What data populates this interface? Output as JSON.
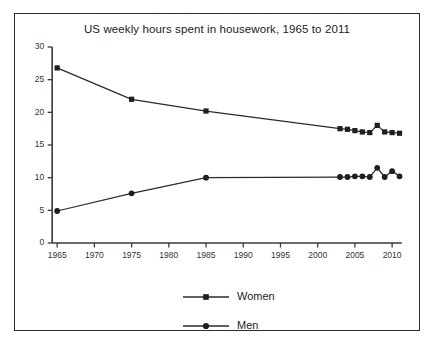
{
  "chart_data": {
    "type": "line",
    "title": "US weekly hours spent in housework, 1965 to 2011",
    "xlabel": "",
    "ylabel": "",
    "xlim": [
      1963.5,
      2012
    ],
    "ylim": [
      0,
      30
    ],
    "xticks": [
      1965,
      1970,
      1975,
      1980,
      1985,
      1990,
      1995,
      2000,
      2005,
      2010
    ],
    "yticks": [
      0,
      5,
      10,
      15,
      20,
      25,
      30
    ],
    "grid": false,
    "legend_position": "bottom",
    "series": [
      {
        "name": "Women",
        "marker": "square",
        "color": "#1f1f1f",
        "x": [
          1965,
          1975,
          1985,
          2003,
          2004,
          2005,
          2006,
          2007,
          2008,
          2009,
          2010,
          2011
        ],
        "values": [
          26.8,
          22.0,
          20.2,
          17.5,
          17.4,
          17.2,
          17.0,
          16.9,
          18.0,
          17.0,
          16.9,
          16.8
        ]
      },
      {
        "name": "Men",
        "marker": "circle",
        "color": "#1f1f1f",
        "x": [
          1965,
          1975,
          1985,
          2003,
          2004,
          2005,
          2006,
          2007,
          2008,
          2009,
          2010,
          2011
        ],
        "values": [
          4.9,
          7.6,
          10.0,
          10.1,
          10.1,
          10.2,
          10.2,
          10.1,
          11.5,
          10.1,
          11.0,
          10.2
        ]
      }
    ]
  },
  "legend": {
    "items": [
      {
        "label": "Women"
      },
      {
        "label": "Men"
      }
    ]
  }
}
